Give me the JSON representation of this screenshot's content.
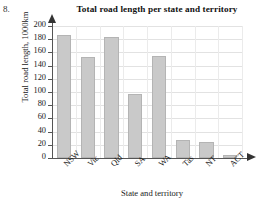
{
  "question_number": "8.",
  "chart_data": {
    "type": "bar",
    "title": "Total road length per state and territory",
    "xlabel": "State and territory",
    "ylabel": "Total road length, 1000km",
    "categories": [
      "NSW",
      "Vic",
      "Qld",
      "SA",
      "WA",
      "Tas",
      "NT",
      "ACT"
    ],
    "values": [
      186,
      153,
      183,
      97,
      155,
      27,
      24,
      5
    ],
    "ylim": [
      0,
      200
    ],
    "ytick_step": 20,
    "yticks": [
      0,
      20,
      40,
      60,
      80,
      100,
      120,
      140,
      160,
      180,
      200
    ],
    "ytick_labels": [
      "0",
      "20",
      "40",
      "60",
      "80",
      "100",
      "120",
      "140",
      "160",
      "180",
      "200"
    ],
    "grid": true,
    "legend": false,
    "bar_color": "#c9c9c9",
    "bar_border_color": "#b4b4b4",
    "axis_color": "#555555",
    "grid_color": "#e2e2e2"
  }
}
